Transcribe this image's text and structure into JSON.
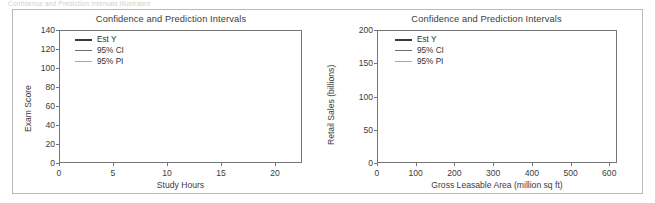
{
  "page": {
    "faint_caption": "Confidence and Prediction Intervals Illustrated",
    "background_color": "#ffffff",
    "frame_color": "#b9b9b9"
  },
  "colors": {
    "est_y": "#3a3a3a",
    "ci": "#6e6e6e",
    "pi": "#a8a8a8",
    "grid": "#d6d6d6",
    "axis": "#767676",
    "text": "#3c3c3c"
  },
  "legend": {
    "items": [
      {
        "label": "Est Y",
        "key": "est_y"
      },
      {
        "label": "95% CI",
        "key": "ci"
      },
      {
        "label": "95% PI",
        "key": "pi"
      }
    ]
  },
  "chart_data": [
    {
      "id": "exam-score-chart",
      "type": "line",
      "title": "Confidence and Prediction Intervals",
      "xlabel": "Study Hours",
      "ylabel": "Exam Score",
      "xlim": [
        0,
        22.5
      ],
      "ylim": [
        0,
        140
      ],
      "xticks": [
        0,
        5,
        10,
        15,
        20
      ],
      "yticks": [
        0,
        20,
        40,
        60,
        80,
        100,
        120,
        140
      ],
      "grid": true,
      "legend_position": "top-left",
      "x": [
        0,
        2,
        4,
        6,
        8,
        10,
        12,
        14,
        16,
        18,
        20,
        22.5
      ],
      "series": [
        {
          "name": "95% PI",
          "key": "pi",
          "role": "upper",
          "values": [
            91,
            92,
            93.5,
            95.5,
            98,
            101,
            104.5,
            108.5,
            113,
            118,
            123.5,
            130
          ]
        },
        {
          "name": "95% CI",
          "key": "ci",
          "role": "upper",
          "values": [
            73,
            73.8,
            75,
            76.5,
            78.5,
            81,
            84.5,
            88.5,
            93.5,
            99,
            105,
            112
          ]
        },
        {
          "name": "Est Y",
          "key": "est_y",
          "role": "fit",
          "values": [
            50,
            53,
            56,
            59,
            62,
            65,
            68.5,
            72,
            76,
            80,
            85,
            90
          ]
        },
        {
          "name": "95% CI",
          "key": "ci",
          "role": "lower",
          "values": [
            27,
            32,
            37,
            42,
            47,
            51.5,
            55.5,
            59,
            62,
            64.5,
            66.5,
            68
          ]
        },
        {
          "name": "95% PI",
          "key": "pi",
          "role": "lower",
          "values": [
            11,
            14.5,
            18.5,
            22.5,
            26.5,
            30.5,
            34.5,
            38.5,
            42,
            45.5,
            49,
            52
          ]
        }
      ]
    },
    {
      "id": "retail-sales-chart",
      "type": "line",
      "title": "Confidence and Prediction Intervals",
      "xlabel": "Gross Leasable Area (million sq ft)",
      "ylabel": "Retail Sales (billions)",
      "xlim": [
        0,
        620
      ],
      "ylim": [
        0,
        200
      ],
      "xticks": [
        0,
        100,
        200,
        300,
        400,
        500,
        600
      ],
      "yticks": [
        0,
        50,
        100,
        150,
        200
      ],
      "grid": true,
      "legend_position": "top-left",
      "x": [
        0,
        100,
        200,
        300,
        400,
        500,
        600
      ],
      "series": [
        {
          "name": "95% PI",
          "key": "pi",
          "role": "upper",
          "values": [
            16,
            43,
            70,
            96,
            122,
            149,
            175
          ]
        },
        {
          "name": "95% CI",
          "key": "ci",
          "role": "upper",
          "values": [
            8,
            35,
            61,
            87,
            113,
            138,
            163
          ]
        },
        {
          "name": "Est Y",
          "key": "est_y",
          "role": "fit",
          "values": [
            5,
            31,
            57,
            83,
            108,
            133,
            158
          ]
        },
        {
          "name": "95% CI",
          "key": "ci",
          "role": "lower",
          "values": [
            2,
            28,
            53,
            79,
            104,
            128,
            152
          ]
        },
        {
          "name": "95% PI",
          "key": "pi",
          "role": "lower",
          "values": [
            -5,
            21,
            45,
            69,
            93,
            117,
            140
          ]
        }
      ]
    }
  ]
}
